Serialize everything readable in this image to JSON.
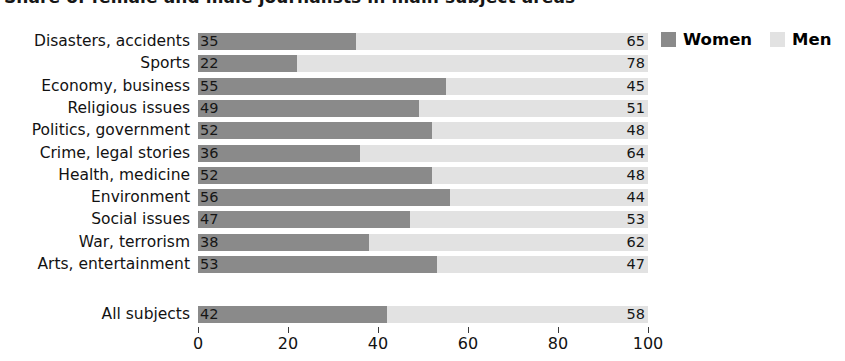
{
  "title": {
    "text": "Share of female and male journalists in main subject areas",
    "clipped": true
  },
  "legend": {
    "position": "top-right",
    "items": [
      {
        "label": "Women",
        "color": "#8a8a8a",
        "swatch_name": "legend-swatch-women"
      },
      {
        "label": "Men",
        "color": "#e2e2e2",
        "swatch_name": "legend-swatch-men"
      }
    ]
  },
  "axis": {
    "ticks": [
      "0",
      "20",
      "40",
      "60",
      "80",
      "100"
    ],
    "values": [
      0,
      20,
      40,
      60,
      80,
      100
    ]
  },
  "chart_data": {
    "type": "bar",
    "orientation": "horizontal",
    "stacked": true,
    "stack_total": 100,
    "title": "Share of female and male journalists in main subject areas",
    "xlabel": "",
    "ylabel": "",
    "xlim": [
      0,
      100
    ],
    "grid": false,
    "legend_position": "top-right",
    "categories": [
      "Disasters, accidents",
      "Sports",
      "Economy, business",
      "Religious issues",
      "Politics, government",
      "Crime, legal stories",
      "Health, medicine",
      "Environment",
      "Social issues",
      "War, terrorism",
      "Arts, entertainment"
    ],
    "series": [
      {
        "name": "Women",
        "color": "#8a8a8a",
        "values": [
          35,
          22,
          55,
          49,
          52,
          36,
          52,
          56,
          47,
          38,
          53
        ]
      },
      {
        "name": "Men",
        "color": "#e2e2e2",
        "values": [
          65,
          78,
          45,
          51,
          48,
          64,
          48,
          44,
          53,
          62,
          47
        ]
      }
    ],
    "summary_row": {
      "category": "All subjects",
      "Women": 42,
      "Men": 58
    }
  }
}
